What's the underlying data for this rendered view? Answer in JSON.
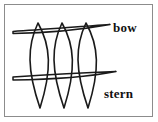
{
  "figure": {
    "title": "",
    "background_color": "#ffffff",
    "frame": {
      "border_color": "#8c8c8c",
      "border_width_px": 1,
      "x": 4,
      "y": 4,
      "width": 149,
      "height": 113
    },
    "stroke_color": "#1a1a1a",
    "labels": {
      "bow": "bow",
      "stern": "stern"
    }
  },
  "diagram_data": {
    "type": "line-drawing",
    "subject": "boat hull frame construction",
    "description": "Three vertical pointed lens-shaped ribs crossed by two horizontal elongated spindle-shaped stringers; the upper stringer is labeled bow and the lower region is labeled stern.",
    "ribs": [
      {
        "name": "rib-1",
        "top_x": 38,
        "top_y": 23,
        "bottom_x": 40,
        "bottom_y": 108,
        "half_width": 12
      },
      {
        "name": "rib-2",
        "top_x": 62,
        "top_y": 23,
        "bottom_x": 64,
        "bottom_y": 108,
        "half_width": 12
      },
      {
        "name": "rib-3",
        "top_x": 86,
        "top_y": 23,
        "bottom_x": 88,
        "bottom_y": 108,
        "half_width": 12
      }
    ],
    "stringers": [
      {
        "name": "stringer-bow",
        "label": "bow",
        "left_x": 13,
        "left_y": 32,
        "right_x": 110,
        "right_y": 25,
        "thickness_px": 4
      },
      {
        "name": "stringer-stern",
        "label": "stern",
        "left_x": 13,
        "left_y": 78,
        "right_x": 116,
        "right_y": 74,
        "thickness_px": 5
      }
    ]
  }
}
